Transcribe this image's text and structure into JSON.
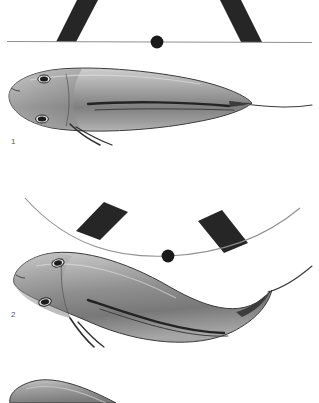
{
  "figure": {
    "background_color": "#ffffff",
    "width": 319,
    "height": 403,
    "caption_style": "numbered-panels"
  },
  "colors": {
    "background": "#ffffff",
    "marker_block": "#262626",
    "axis_line": "#8c8c8c",
    "dot_marker": "#1a1a1a",
    "body_outline": "#3b3b3b",
    "body_light": "#d9d9d9",
    "body_mid": "#9a9a9a",
    "body_dark": "#5a5a5a",
    "fin_line": "#2e2e2e",
    "eye": "#1c1c1c",
    "label_text": "#58585a"
  },
  "panels": [
    {
      "id": "panel-1",
      "label": "1",
      "label_x": 11,
      "label_y": 144,
      "reference": {
        "type": "straight-line",
        "description": "horizontal reference line with centre dot marker",
        "line_y": 42,
        "dot_x": 157,
        "dot_y": 42,
        "dot_radius": 6.5
      },
      "markers": [
        {
          "name": "marker-block-left",
          "shape": "slanted-bar",
          "tilt": "down-right"
        },
        {
          "name": "marker-block-right",
          "shape": "slanted-bar",
          "tilt": "down-left"
        }
      ],
      "fish": {
        "posture": "straight",
        "head_side": "left",
        "tail_side": "right",
        "eyes": 2,
        "barbels": 4
      }
    },
    {
      "id": "panel-2",
      "label": "2",
      "label_x": 11,
      "label_y": 317,
      "reference": {
        "type": "arc",
        "description": "downward-bowed reference arc with centre dot marker",
        "dot_x": 168,
        "dot_y": 255,
        "dot_radius": 6.5
      },
      "markers": [
        {
          "name": "marker-block-left",
          "shape": "slanted-bar",
          "tilt": "down-right"
        },
        {
          "name": "marker-block-right",
          "shape": "slanted-bar",
          "tilt": "down-left"
        }
      ],
      "fish": {
        "posture": "curved",
        "head_side": "left",
        "tail_side": "right",
        "eyes": 2,
        "barbels": 4
      }
    },
    {
      "id": "panel-3",
      "label": "",
      "reference": {
        "type": "none"
      },
      "markers": [],
      "fish": {
        "posture": "curved",
        "head_side": "left",
        "tail_side": "right",
        "cropped": true,
        "eyes": 0,
        "barbels": 0
      }
    }
  ]
}
